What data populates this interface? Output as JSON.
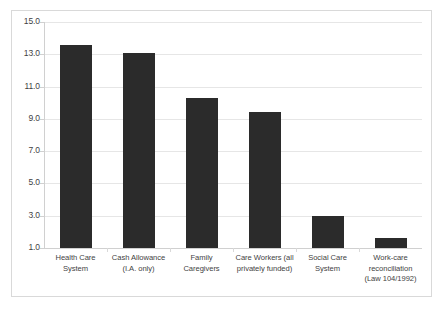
{
  "chart_data": {
    "type": "bar",
    "title": "",
    "xlabel": "",
    "ylabel": "",
    "ylim": [
      1.0,
      15.0
    ],
    "ytick_step": 2.0,
    "grid": true,
    "legend": "none",
    "bar_color": "#2b2b2b",
    "gridline_color": "#e6e6e6",
    "axis_color": "#d0d0d0",
    "text_color": "#3f3f3f",
    "border_color": "#d9d9d9",
    "background": "#ffffff",
    "ytick_labels": [
      "15.0",
      "13.0",
      "11.0",
      "9.0",
      "7.0",
      "5.0",
      "3.0",
      "1.0"
    ],
    "ytick_values": [
      15.0,
      13.0,
      11.0,
      9.0,
      7.0,
      5.0,
      3.0,
      1.0
    ],
    "categories": [
      "Health Care System",
      "Cash Allowance (I.A. only)",
      "Family Caregivers",
      "Care Workers (all privately funded)",
      "Social Care System",
      "Work-care reconciliation (Law 104/1992)"
    ],
    "category_lines": [
      [
        "Health Care",
        "System"
      ],
      [
        "Cash Allowance",
        "(I.A. only)"
      ],
      [
        "Family",
        "Caregivers"
      ],
      [
        "Care Workers (all",
        "privately funded)"
      ],
      [
        "Social Care",
        "System"
      ],
      [
        "Work-care",
        "reconciliation",
        "(Law 104/1992)"
      ]
    ],
    "values": [
      13.6,
      13.1,
      10.3,
      9.4,
      3.0,
      1.6
    ]
  }
}
